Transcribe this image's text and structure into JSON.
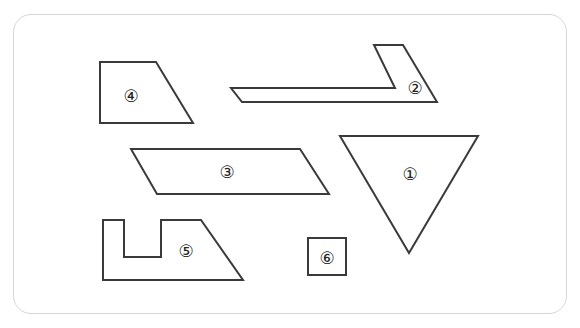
{
  "figure": {
    "stroke_color": "#3a3a3a",
    "frame_border_color": "#d6d6d6",
    "shapes": [
      {
        "id": "1",
        "label": "①",
        "kind": "inverted-triangle",
        "points": "340,136 478,136 409,253",
        "label_pos": [
          410,
          174
        ]
      },
      {
        "id": "2",
        "label": "②",
        "kind": "hook-parallelogram",
        "points": "231,88 395,88 374,45 403,45 437,102 242,102",
        "label_pos": [
          415,
          88
        ]
      },
      {
        "id": "3",
        "label": "③",
        "kind": "parallelogram",
        "points": "131,149 300,149 329,194 157,194",
        "label_pos": [
          227,
          172
        ]
      },
      {
        "id": "4",
        "label": "④",
        "kind": "right-trapezoid",
        "points": "100,62 156,62 193,123 100,123",
        "label_pos": [
          131,
          96
        ]
      },
      {
        "id": "5",
        "label": "⑤",
        "kind": "notched-trapezoid",
        "points": "103,220 124,220 124,257 161,257 161,220 201,220 243,280 103,280",
        "label_pos": [
          186,
          251
        ]
      },
      {
        "id": "6",
        "label": "⑥",
        "kind": "square",
        "points": "308,238 346,238 346,275 308,275",
        "label_pos": [
          327,
          258
        ]
      }
    ]
  }
}
